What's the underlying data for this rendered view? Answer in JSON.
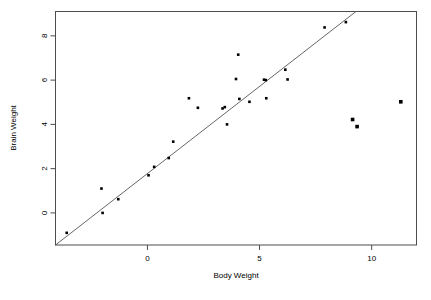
{
  "chart_data": {
    "type": "scatter",
    "title": "",
    "xlabel": "Body Weight",
    "ylabel": "Brain Weight",
    "xlim": [
      -4.1,
      12.0
    ],
    "ylim": [
      -1.45,
      9.1
    ],
    "xticks": [
      0,
      5,
      10
    ],
    "xticklabels": [
      "0",
      "5",
      "10"
    ],
    "yticks": [
      0,
      2,
      4,
      6,
      8
    ],
    "yticklabels": [
      "0",
      "2",
      "4",
      "6",
      "8"
    ],
    "grid": false,
    "legend": null,
    "series": [
      {
        "name": "observations",
        "marker": "filled-square",
        "color": "#000000",
        "points": [
          {
            "x": -3.6,
            "y": -0.9
          },
          {
            "x": -2.05,
            "y": 1.1
          },
          {
            "x": -2.0,
            "y": 0.0
          },
          {
            "x": -1.3,
            "y": 0.62
          },
          {
            "x": 0.05,
            "y": 1.7
          },
          {
            "x": 0.3,
            "y": 2.08
          },
          {
            "x": 0.95,
            "y": 2.48
          },
          {
            "x": 1.15,
            "y": 3.22
          },
          {
            "x": 1.85,
            "y": 5.18
          },
          {
            "x": 2.25,
            "y": 4.75
          },
          {
            "x": 3.35,
            "y": 4.72
          },
          {
            "x": 3.45,
            "y": 4.78
          },
          {
            "x": 3.55,
            "y": 4.0
          },
          {
            "x": 3.95,
            "y": 6.05
          },
          {
            "x": 4.05,
            "y": 7.15
          },
          {
            "x": 4.1,
            "y": 5.15
          },
          {
            "x": 4.55,
            "y": 5.02
          },
          {
            "x": 5.2,
            "y": 6.02
          },
          {
            "x": 5.28,
            "y": 6.0
          },
          {
            "x": 5.3,
            "y": 5.18
          },
          {
            "x": 6.15,
            "y": 6.47
          },
          {
            "x": 6.25,
            "y": 6.03
          },
          {
            "x": 7.9,
            "y": 8.38
          },
          {
            "x": 8.85,
            "y": 8.62
          }
        ]
      },
      {
        "name": "outliers",
        "marker": "filled-square-large",
        "color": "#000000",
        "points": [
          {
            "x": 9.15,
            "y": 4.22
          },
          {
            "x": 9.35,
            "y": 3.9
          },
          {
            "x": 11.3,
            "y": 5.02
          }
        ]
      }
    ],
    "fit_line": {
      "name": "regression-line",
      "color": "#555555",
      "x0": -4.1,
      "y0": -1.45,
      "x1": 9.3,
      "y1": 9.1
    }
  },
  "axes": {
    "x_title": "Body Weight",
    "y_title": "Brain Weight"
  }
}
